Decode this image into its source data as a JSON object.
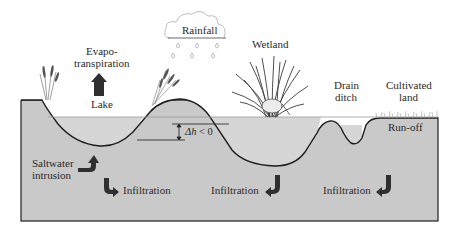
{
  "diagram": {
    "labels": {
      "rainfall": "Rainfall",
      "evapo_line1": "Evapo-",
      "evapo_line2": "transpiration",
      "lake": "Lake",
      "wetland": "Wetland",
      "drain_line1": "Drain",
      "drain_line2": "ditch",
      "cultivated_line1": "Cultivated",
      "cultivated_line2": "land",
      "runoff": "Run-off",
      "delta_h_symbol": "Δh",
      "delta_h_rest": " < 0",
      "saltwater_line1": "Saltwater",
      "saltwater_line2": "intrusion",
      "infiltration_1": "Infiltration",
      "infiltration_2": "Infiltration",
      "infiltration_3": "Infiltration"
    },
    "icons": {
      "cloud": "cloud-icon",
      "raindrops": "raindrop-icon",
      "evapotranspiration_arrow": "arrow-up-icon",
      "saltwater_arrow": "curved-arrow-up-right-icon",
      "infiltration_arrows": "curved-arrow-down-icon",
      "reeds": "reed-plant-icon",
      "wetland_grass": "grass-tuft-icon"
    },
    "colors": {
      "ground": "#c9c9c9",
      "water": "#d6d6d6",
      "outline": "#1e1e1e",
      "arrow": "#2a2a2a"
    }
  }
}
